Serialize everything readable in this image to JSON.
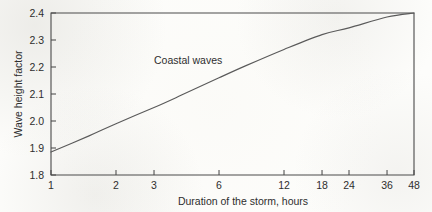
{
  "chart_data": {
    "type": "line",
    "title": "",
    "xlabel": "Duration of the storm, hours",
    "ylabel": "Wave height factor",
    "xscale": "log",
    "yscale": "linear",
    "xlim": [
      1,
      48
    ],
    "ylim": [
      1.8,
      2.4
    ],
    "grid": false,
    "legend": "none",
    "xticks": [
      1,
      2,
      3,
      6,
      12,
      18,
      24,
      36,
      48
    ],
    "xtick_labels": [
      "1",
      "2",
      "3",
      "6",
      "12",
      "18",
      "24",
      "36",
      "48"
    ],
    "yticks": [
      1.8,
      1.9,
      2.0,
      2.1,
      2.2,
      2.3,
      2.4
    ],
    "ytick_labels": [
      "1.8",
      "1.9",
      "2.0",
      "2.1",
      "2.2",
      "2.3",
      "2.4"
    ],
    "annotations": [
      {
        "text": "Coastal waves",
        "x": 3.0,
        "y": 2.21
      }
    ],
    "series": [
      {
        "name": "Coastal waves",
        "color": "#5a5a5a",
        "x": [
          1,
          1.5,
          2,
          3,
          4,
          6,
          8,
          12,
          18,
          24,
          36,
          48
        ],
        "values": [
          1.885,
          1.945,
          1.99,
          2.05,
          2.095,
          2.16,
          2.205,
          2.265,
          2.32,
          2.345,
          2.385,
          2.4
        ]
      }
    ]
  },
  "axes": {
    "y_title": "Wave height factor",
    "x_title": "Duration of the storm, hours"
  },
  "annotation": {
    "coastal_waves": "Coastal waves"
  },
  "colors": {
    "curve": "#5a5a5a",
    "axis": "#4a4a4a",
    "text": "#2e2e2e",
    "background": "#fdfdfb"
  }
}
